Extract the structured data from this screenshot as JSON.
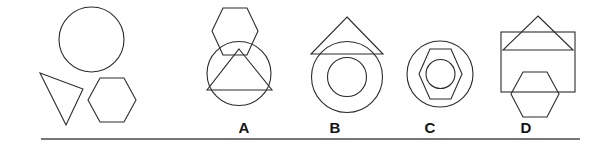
{
  "puzzle": {
    "type": "shape-composition-multiple-choice",
    "stroke_color": "#2b2b2b",
    "rule_color": "#4a4a4a",
    "background_color": "#ffffff",
    "prompt_panel": {
      "name": "given-shapes",
      "shapes": [
        {
          "id": "prompt-circle",
          "kind": "circle",
          "cx": 91.5,
          "cy": 39.5,
          "r": 32.5
        },
        {
          "id": "prompt-triangle",
          "kind": "triangle",
          "points": "40,73 83,89 66,125"
        },
        {
          "id": "prompt-hexagon",
          "kind": "hexagon",
          "points": "100,78 124,78 136,100 124,122 100,122 88,100"
        }
      ]
    },
    "options": [
      {
        "id": "option-a",
        "label": "A",
        "label_x": 244,
        "label_y": 122,
        "shapes": [
          {
            "id": "a-hexagon",
            "kind": "hexagon",
            "points": "223,8 247,8 258,31 247,55 223,55 212,31"
          },
          {
            "id": "a-circle",
            "kind": "circle",
            "cx": 239,
            "cy": 73.5,
            "r": 32
          },
          {
            "id": "a-triangle",
            "kind": "triangle",
            "points": "239,49 272,90 207,90"
          }
        ]
      },
      {
        "id": "option-b",
        "label": "B",
        "label_x": 335,
        "label_y": 122,
        "shapes": [
          {
            "id": "b-triangle",
            "kind": "triangle",
            "points": "347,17 383,54 311,54"
          },
          {
            "id": "b-circle-outer",
            "kind": "circle",
            "cx": 347,
            "cy": 77,
            "r": 35.5
          },
          {
            "id": "b-circle-inner",
            "kind": "circle",
            "cx": 347,
            "cy": 77,
            "r": 19.5
          }
        ]
      },
      {
        "id": "option-c",
        "label": "C",
        "label_x": 430,
        "label_y": 122,
        "shapes": [
          {
            "id": "c-circle-outer",
            "kind": "circle",
            "cx": 440,
            "cy": 74,
            "r": 33
          },
          {
            "id": "c-hexagon",
            "kind": "hexagon",
            "points": "430,49 451,49 462,74 451,99 430,99 419,74"
          },
          {
            "id": "c-circle-inner",
            "kind": "circle",
            "cx": 440.5,
            "cy": 74,
            "r": 14.5
          }
        ]
      },
      {
        "id": "option-d",
        "label": "D",
        "label_x": 526,
        "label_y": 122,
        "shapes": [
          {
            "id": "d-rectangle",
            "kind": "rectangle",
            "x": 501,
            "y": 32,
            "width": 74,
            "height": 60
          },
          {
            "id": "d-triangle",
            "kind": "triangle",
            "points": "538,16 573,50 503,50"
          },
          {
            "id": "d-hexagon",
            "kind": "hexagon",
            "points": "523,72 547,72 559,94 547,117 523,117 511,94"
          }
        ]
      }
    ],
    "rule": {
      "id": "baseline-rule",
      "x1": 41,
      "y1": 139,
      "x2": 580,
      "y2": 139
    }
  }
}
